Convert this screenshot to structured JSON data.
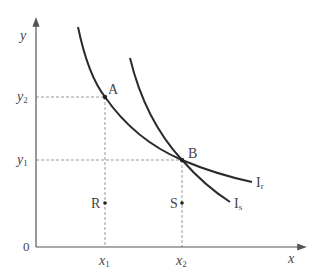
{
  "diagram": {
    "axes": {
      "x_label": "x",
      "y_label": "y",
      "origin": "0"
    },
    "ticks": {
      "x": [
        "x1",
        "x2"
      ],
      "y": [
        "y1",
        "y2"
      ]
    },
    "tick_text": {
      "x1_base": "x",
      "x1_sub": "1",
      "x2_base": "x",
      "x2_sub": "2",
      "y1_base": "y",
      "y1_sub": "1",
      "y2_base": "y",
      "y2_sub": "2"
    },
    "points": [
      {
        "label": "A",
        "desc": "intersection of Ir and Is at (x2, y1)"
      },
      {
        "label": "B",
        "desc": "on Ir at (x1, y2)"
      },
      {
        "label": "R",
        "desc": "at x1, below y1"
      },
      {
        "label": "S",
        "desc": "at x2, below y1"
      }
    ],
    "curves": [
      {
        "name": "Ir",
        "base": "I",
        "sub": "r"
      },
      {
        "name": "Is",
        "base": "I",
        "sub": "s"
      }
    ],
    "colors": {
      "curve": "#2a2a2a",
      "axis": "#555555",
      "dash": "#999999",
      "text": "#444444"
    }
  }
}
